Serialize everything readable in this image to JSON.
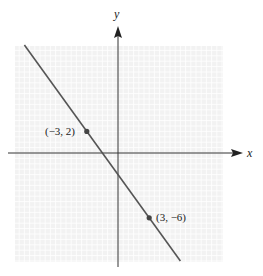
{
  "chart_data": {
    "type": "line",
    "title": "",
    "xlabel": "x",
    "ylabel": "y",
    "xlim": [
      -10,
      10
    ],
    "ylim": [
      -10,
      10
    ],
    "grid": true,
    "series": [
      {
        "name": "line through (-3, 2) and (3, -6)",
        "slope": -1.3333,
        "intercept": -2,
        "x": [
          -9,
          6
        ],
        "y": [
          10,
          -10
        ]
      }
    ],
    "points": [
      {
        "x": -3,
        "y": 2,
        "label": "(−3, 2)"
      },
      {
        "x": 3,
        "y": -6,
        "label": "(3, −6)"
      }
    ],
    "colors": {
      "grid_bg": "#f2f2f2",
      "grid_line": "#ffffff",
      "axis": "#333333",
      "line": "#555555",
      "point": "#444444"
    }
  },
  "labels": {
    "x_axis": "x",
    "y_axis": "y",
    "point_a": "(−3, 2)",
    "point_b": "(3, −6)"
  }
}
